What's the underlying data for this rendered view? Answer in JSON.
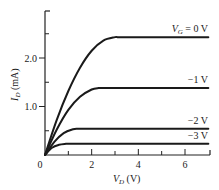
{
  "chart_data": {
    "type": "line",
    "title": "",
    "xlabel": "V_D (V)",
    "ylabel": "I_D (mA)",
    "xlabel_parts": {
      "main": "V",
      "sub": "D",
      "unit": " (V)"
    },
    "ylabel_parts": {
      "main": "I",
      "sub": "D",
      "unit": " (mA)"
    },
    "xlim": [
      0,
      7
    ],
    "ylim": [
      0,
      3
    ],
    "x_major_ticks": [
      0,
      2,
      4,
      6
    ],
    "x_minor_ticks": [
      1,
      3,
      5
    ],
    "x_tick_labels": [
      "0",
      "2",
      "4",
      "6"
    ],
    "y_major_ticks": [
      1.0,
      2.0
    ],
    "y_minor_ticks": [
      0.5,
      1.5,
      2.5
    ],
    "y_tick_labels": [
      "1.0",
      "2.0"
    ],
    "grid": false,
    "legend": "inline labels at right end of each curve",
    "series": [
      {
        "name": "V_G = 0 V",
        "label": "V_G = 0 V",
        "vg": 0,
        "saturation_current": 2.43,
        "saturation_voltage": 3.1,
        "x": [
          0,
          0.5,
          1.0,
          1.5,
          2.0,
          2.5,
          3.0,
          3.1,
          7.0
        ],
        "y": [
          0,
          0.72,
          1.32,
          1.8,
          2.15,
          2.36,
          2.43,
          2.43,
          2.43
        ]
      },
      {
        "name": "V_G = -1 V",
        "label": "−1 V",
        "vg": -1,
        "saturation_current": 1.38,
        "saturation_voltage": 2.3,
        "x": [
          0,
          0.5,
          1.0,
          1.5,
          2.0,
          2.3,
          7.0
        ],
        "y": [
          0,
          0.52,
          0.93,
          1.2,
          1.35,
          1.38,
          1.38
        ]
      },
      {
        "name": "V_G = -2 V",
        "label": "−2 V",
        "vg": -2,
        "saturation_current": 0.54,
        "saturation_voltage": 1.4,
        "x": [
          0,
          0.4,
          0.8,
          1.2,
          1.4,
          7.0
        ],
        "y": [
          0,
          0.27,
          0.45,
          0.53,
          0.54,
          0.54
        ]
      },
      {
        "name": "V_G = -3 V",
        "label": "−3 V",
        "vg": -3,
        "saturation_current": 0.23,
        "saturation_voltage": 0.9,
        "x": [
          0,
          0.3,
          0.6,
          0.9,
          7.0
        ],
        "y": [
          0,
          0.15,
          0.21,
          0.23,
          0.23
        ]
      }
    ]
  }
}
